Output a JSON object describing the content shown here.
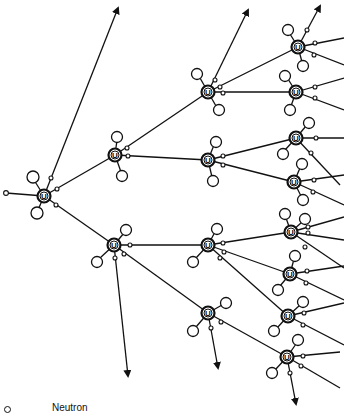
{
  "legend": {
    "neutron_label": "Neutron"
  },
  "colors": {
    "ink": "#111111",
    "background": "#ffffff"
  },
  "nuclei": [
    {
      "id": "n0",
      "x": 44,
      "y": 196,
      "label": "U"
    },
    {
      "id": "n1",
      "x": 115,
      "y": 155,
      "label": "U"
    },
    {
      "id": "n2",
      "x": 114,
      "y": 245,
      "label": "U"
    },
    {
      "id": "n3",
      "x": 208,
      "y": 92,
      "label": "U"
    },
    {
      "id": "n4",
      "x": 208,
      "y": 160,
      "label": "U"
    },
    {
      "id": "n5",
      "x": 208,
      "y": 245,
      "label": "U"
    },
    {
      "id": "n6",
      "x": 208,
      "y": 313,
      "label": "U"
    },
    {
      "id": "n7",
      "x": 298,
      "y": 47,
      "label": "U"
    },
    {
      "id": "n8",
      "x": 296,
      "y": 92,
      "label": "U"
    },
    {
      "id": "n9",
      "x": 296,
      "y": 138,
      "label": "U"
    },
    {
      "id": "n10",
      "x": 294,
      "y": 182,
      "label": "U"
    },
    {
      "id": "n11",
      "x": 291,
      "y": 232,
      "label": "U"
    },
    {
      "id": "n12",
      "x": 290,
      "y": 274,
      "label": "U"
    },
    {
      "id": "n13",
      "x": 288,
      "y": 316,
      "label": "U"
    },
    {
      "id": "n14",
      "x": 287,
      "y": 357,
      "label": "U"
    }
  ]
}
